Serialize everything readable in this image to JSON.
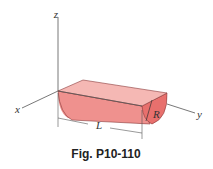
{
  "figure": {
    "caption": "Fig. P10-110",
    "axes": {
      "x": "x",
      "y": "y",
      "z": "z"
    },
    "dimensions": {
      "length": "L",
      "radius": "R"
    },
    "colors": {
      "top_face": "#f4b3b0",
      "side_face": "#ee8f8c",
      "end_face": "#e8706d",
      "edge": "#8a3a3a",
      "axis": "#555555"
    }
  }
}
